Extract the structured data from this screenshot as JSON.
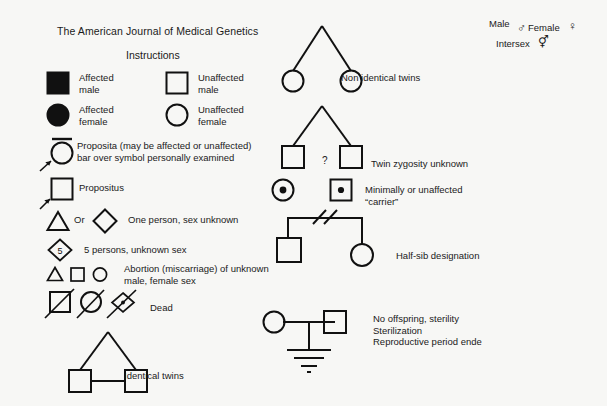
{
  "header": {
    "title": "The American Journal of Medical Genetics",
    "subtitle": "Instructions"
  },
  "legend": {
    "affected_male": "Affected\nmale",
    "unaffected_male": "Unaffected\nmale",
    "affected_female": "Affected\nfemale",
    "unaffected_female": "Unaffected\nfemale",
    "proposita": "Proposita (may be affected or unaffected)\nbar over symbol personally examined",
    "propositus": "Propositus",
    "or_label": "Or",
    "one_person": "One person, sex unknown",
    "five_persons_count": "5",
    "five_persons": "5 persons, unknown sex",
    "abortion": "Abortion (miscarriage) of unknown\nmale, female sex",
    "dead": "Dead",
    "identical_twins": "Identical twins",
    "non_identical_twins": "Non identical twins",
    "twin_zygosity_unknown": "Twin zygosity unknown",
    "zygosity_question_mark": "?",
    "carrier": "Minimally or unaffected\n“carrier”",
    "half_sib": "Half-sib designation",
    "no_offspring": "No offspring, sterility\nSterilization\nReproductive period ende"
  },
  "sex_symbols": {
    "male_label": "Male",
    "male_glyph": "♂",
    "female_label": "Female",
    "female_glyph": "♀",
    "intersex_label": "Intersex",
    "intersex_glyph": "⚥"
  },
  "colors": {
    "ink": "#1a1a1a",
    "background": "#f7f7f5",
    "affected_fill": "#111111"
  }
}
